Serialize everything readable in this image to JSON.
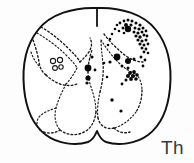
{
  "figure": {
    "kind": "line-drawing",
    "label": "Th",
    "label_position": {
      "x": 161,
      "y": 138
    },
    "canvas": {
      "width": 194,
      "height": 163
    },
    "colors": {
      "background": "#fdfdfd",
      "outline": "#111111",
      "gray_matter_dashed": "#1a1a1a",
      "dot_fill": "#080808",
      "label": "#3a3a3a"
    }
  },
  "chart_data": {
    "type": "scatter",
    "title": "",
    "subtitle": "",
    "xlabel": "",
    "ylabel": "",
    "annotations": [
      "Th"
    ],
    "grid": false,
    "legend": null,
    "xlim": [
      0,
      194
    ],
    "ylim": [
      0,
      163
    ],
    "outer_outline_path": "M 97 8 C 74 7 50 14 38 30 C 26 45 22 66 24 88 C 26 110 34 126 46 135 C 58 144 76 146 88 142 C 93 140 95 136 97 131 C 99 136 101 140 106 142 C 118 146 136 144 148 135 C 160 126 168 110 170 88 C 172 66 168 45 156 30 C 144 14 120 7 97 8 Z",
    "dorsal_septum_path": "M 97 9 L 97 26",
    "gray_matter_paths": [
      "M 41 27 C 50 32 60 40 68 48 C 74 54 78 58 80 62",
      "M 37 33 C 47 39 57 46 65 54 C 71 60 75 64 77 68",
      "M 33 40 C 36 48 38 56 39 62 C 40 68 42 72 46 75",
      "M 31 52 C 33 58 36 63 40 67",
      "M 80 62 C 84 58 88 54 90 50 C 92 46 92 42 90 38",
      "M 77 68 C 74 74 70 80 66 84",
      "M 46 75 C 50 79 55 82 60 84 C 66 86 72 86 77 84",
      "M 66 84 C 62 92 58 100 56 108 C 54 116 55 124 60 130",
      "M 60 130 C 68 136 78 136 86 131 C 92 127 95 120 96 112",
      "M 96 112 C 96 104 94 96 92 90 C 90 84 88 78 88 72",
      "M 88 72 C 88 64 90 56 92 50",
      "M 56 108 C 50 110 44 112 40 116 C 36 120 36 126 40 130",
      "M 40 130 C 46 134 54 134 60 130",
      "M 101 40 C 106 48 112 56 118 62 C 124 68 130 72 136 74",
      "M 104 34 C 110 42 118 50 126 56 C 132 60 138 62 143 62",
      "M 136 74 C 140 78 142 84 142 90",
      "M 142 90 C 142 98 140 106 136 112",
      "M 136 112 C 130 120 122 126 114 128",
      "M 114 128 C 106 130 100 126 98 118",
      "M 98 118 C 97 110 98 100 100 92",
      "M 100 92 C 102 84 104 74 103 64",
      "M 103 64 C 102 54 101 46 101 40",
      "M 114 128 C 118 132 124 134 130 132"
    ],
    "open_cell_circles": [
      {
        "cx": 53,
        "cy": 61,
        "r": 2.6
      },
      {
        "cx": 60,
        "cy": 60,
        "r": 2.6
      },
      {
        "cx": 55,
        "cy": 68,
        "r": 2.4
      },
      {
        "cx": 61,
        "cy": 67,
        "r": 2.2
      }
    ],
    "dots": [
      {
        "x": 124,
        "y": 21,
        "r": 1.4
      },
      {
        "x": 128,
        "y": 20,
        "r": 1.5
      },
      {
        "x": 132,
        "y": 21,
        "r": 1.5
      },
      {
        "x": 120,
        "y": 23,
        "r": 1.4
      },
      {
        "x": 136,
        "y": 23,
        "r": 1.5
      },
      {
        "x": 117,
        "y": 25,
        "r": 1.3
      },
      {
        "x": 140,
        "y": 25,
        "r": 1.6
      },
      {
        "x": 126,
        "y": 25,
        "r": 2.0
      },
      {
        "x": 131,
        "y": 25,
        "r": 1.6
      },
      {
        "x": 123,
        "y": 28,
        "r": 1.5
      },
      {
        "x": 128,
        "y": 29,
        "r": 3.2
      },
      {
        "x": 135,
        "y": 28,
        "r": 1.5
      },
      {
        "x": 139,
        "y": 29,
        "r": 1.6
      },
      {
        "x": 143,
        "y": 28,
        "r": 1.5
      },
      {
        "x": 115,
        "y": 29,
        "r": 1.3
      },
      {
        "x": 119,
        "y": 31,
        "r": 1.3
      },
      {
        "x": 134,
        "y": 32,
        "r": 1.5
      },
      {
        "x": 138,
        "y": 33,
        "r": 1.6
      },
      {
        "x": 142,
        "y": 32,
        "r": 1.5
      },
      {
        "x": 146,
        "y": 31,
        "r": 1.4
      },
      {
        "x": 124,
        "y": 33,
        "r": 1.3
      },
      {
        "x": 136,
        "y": 36,
        "r": 1.6
      },
      {
        "x": 140,
        "y": 37,
        "r": 1.7
      },
      {
        "x": 144,
        "y": 35,
        "r": 1.5
      },
      {
        "x": 147,
        "y": 36,
        "r": 1.4
      },
      {
        "x": 112,
        "y": 34,
        "r": 1.3
      },
      {
        "x": 138,
        "y": 40,
        "r": 1.6
      },
      {
        "x": 142,
        "y": 41,
        "r": 1.6
      },
      {
        "x": 146,
        "y": 40,
        "r": 1.5
      },
      {
        "x": 110,
        "y": 39,
        "r": 1.3
      },
      {
        "x": 140,
        "y": 44,
        "r": 1.6
      },
      {
        "x": 144,
        "y": 45,
        "r": 1.5
      },
      {
        "x": 148,
        "y": 44,
        "r": 1.4
      },
      {
        "x": 142,
        "y": 48,
        "r": 1.5
      },
      {
        "x": 146,
        "y": 49,
        "r": 1.4
      },
      {
        "x": 108,
        "y": 45,
        "r": 1.3
      },
      {
        "x": 144,
        "y": 52,
        "r": 1.4
      },
      {
        "x": 148,
        "y": 53,
        "r": 1.3
      },
      {
        "x": 117,
        "y": 57,
        "r": 3.4
      },
      {
        "x": 128,
        "y": 61,
        "r": 3.0
      },
      {
        "x": 134,
        "y": 59,
        "r": 1.5
      },
      {
        "x": 141,
        "y": 57,
        "r": 1.5
      },
      {
        "x": 145,
        "y": 60,
        "r": 1.4
      },
      {
        "x": 110,
        "y": 62,
        "r": 1.6
      },
      {
        "x": 122,
        "y": 66,
        "r": 1.5
      },
      {
        "x": 128,
        "y": 68,
        "r": 1.5
      },
      {
        "x": 143,
        "y": 66,
        "r": 1.4
      },
      {
        "x": 130,
        "y": 73,
        "r": 1.9
      },
      {
        "x": 134,
        "y": 72,
        "r": 1.9
      },
      {
        "x": 128,
        "y": 76,
        "r": 2.0
      },
      {
        "x": 133,
        "y": 76,
        "r": 2.1
      },
      {
        "x": 137,
        "y": 75,
        "r": 1.8
      },
      {
        "x": 131,
        "y": 79,
        "r": 1.9
      },
      {
        "x": 136,
        "y": 79,
        "r": 1.8
      },
      {
        "x": 126,
        "y": 80,
        "r": 1.5
      },
      {
        "x": 122,
        "y": 84,
        "r": 1.4
      },
      {
        "x": 112,
        "y": 100,
        "r": 1.7
      },
      {
        "x": 121,
        "y": 111,
        "r": 1.6
      },
      {
        "x": 88,
        "y": 68,
        "r": 3.4
      },
      {
        "x": 88,
        "y": 78,
        "r": 2.6
      },
      {
        "x": 87,
        "y": 83,
        "r": 1.6
      },
      {
        "x": 92,
        "y": 57,
        "r": 1.6
      },
      {
        "x": 95,
        "y": 70,
        "r": 1.4
      },
      {
        "x": 104,
        "y": 63,
        "r": 1.3
      },
      {
        "x": 107,
        "y": 77,
        "r": 1.3
      }
    ]
  },
  "label": {
    "text": "Th"
  }
}
